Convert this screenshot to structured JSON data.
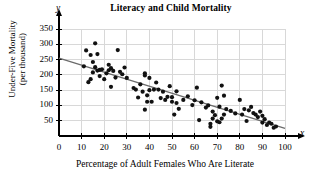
{
  "chart_data": {
    "type": "scatter",
    "title": "Literacy and Child Mortality",
    "xlabel": "Percentage of Adult Females Who Are Literate",
    "ylabel_line1": "Under-Five Mortality",
    "ylabel_line2": "(per thousand)",
    "x_axis_variable": "x",
    "y_axis_variable": "y",
    "xlim": [
      0,
      100
    ],
    "ylim": [
      0,
      350
    ],
    "xticks": [
      0,
      10,
      20,
      30,
      40,
      50,
      60,
      70,
      80,
      90,
      100
    ],
    "yticks": [
      50,
      100,
      150,
      200,
      250,
      300,
      350
    ],
    "grid": true,
    "legend": "none",
    "marker_color": "#111111",
    "grid_color": "#d8d8d8",
    "axis_color": "#000000",
    "trendline_color": "#6b6b6b",
    "trendline": {
      "label": "least-squares regression line",
      "x_start": 0,
      "y_start": 255,
      "x_end": 100,
      "y_end": 25
    },
    "points": [
      [
        11,
        228
      ],
      [
        12,
        280
      ],
      [
        13,
        176
      ],
      [
        14,
        186
      ],
      [
        14,
        265
      ],
      [
        15,
        242
      ],
      [
        15,
        208
      ],
      [
        16,
        303
      ],
      [
        16,
        225
      ],
      [
        17,
        268
      ],
      [
        17,
        214
      ],
      [
        18,
        216
      ],
      [
        18,
        196
      ],
      [
        19,
        218
      ],
      [
        20,
        186
      ],
      [
        21,
        205
      ],
      [
        22,
        233
      ],
      [
        22,
        215
      ],
      [
        23,
        161
      ],
      [
        23,
        222
      ],
      [
        24,
        213
      ],
      [
        25,
        191
      ],
      [
        26,
        281
      ],
      [
        27,
        210
      ],
      [
        28,
        202
      ],
      [
        29,
        224
      ],
      [
        30,
        190
      ],
      [
        33,
        157
      ],
      [
        34,
        152
      ],
      [
        35,
        126
      ],
      [
        36,
        169
      ],
      [
        37,
        145
      ],
      [
        38,
        205
      ],
      [
        38,
        198
      ],
      [
        38,
        86
      ],
      [
        39,
        133
      ],
      [
        39,
        112
      ],
      [
        40,
        190
      ],
      [
        40,
        150
      ],
      [
        41,
        112
      ],
      [
        42,
        152
      ],
      [
        43,
        175
      ],
      [
        44,
        152
      ],
      [
        45,
        124
      ],
      [
        46,
        145
      ],
      [
        47,
        118
      ],
      [
        48,
        128
      ],
      [
        49,
        163
      ],
      [
        50,
        112
      ],
      [
        50,
        127
      ],
      [
        51,
        70
      ],
      [
        52,
        146
      ],
      [
        52,
        108
      ],
      [
        53,
        89
      ],
      [
        55,
        118
      ],
      [
        57,
        130
      ],
      [
        59,
        101
      ],
      [
        60,
        117
      ],
      [
        61,
        158
      ],
      [
        62,
        52
      ],
      [
        63,
        110
      ],
      [
        65,
        93
      ],
      [
        66,
        100
      ],
      [
        67,
        30
      ],
      [
        67,
        40
      ],
      [
        68,
        80
      ],
      [
        68,
        57
      ],
      [
        69,
        68
      ],
      [
        70,
        125
      ],
      [
        70,
        48
      ],
      [
        71,
        96
      ],
      [
        71,
        45
      ],
      [
        72,
        165
      ],
      [
        72,
        57
      ],
      [
        73,
        132
      ],
      [
        73,
        70
      ],
      [
        74,
        88
      ],
      [
        76,
        82
      ],
      [
        78,
        74
      ],
      [
        80,
        118
      ],
      [
        81,
        70
      ],
      [
        82,
        88
      ],
      [
        83,
        49
      ],
      [
        84,
        84
      ],
      [
        85,
        95
      ],
      [
        86,
        75
      ],
      [
        87,
        70
      ],
      [
        88,
        62
      ],
      [
        89,
        80
      ],
      [
        90,
        44
      ],
      [
        90,
        66
      ],
      [
        91,
        55
      ],
      [
        92,
        36
      ],
      [
        93,
        44
      ],
      [
        94,
        40
      ],
      [
        95,
        27
      ],
      [
        96,
        31
      ]
    ]
  }
}
